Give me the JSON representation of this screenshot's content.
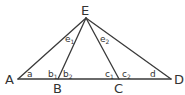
{
  "diagram": {
    "type": "geometry-triangle",
    "line_color": "#3a3a3a",
    "points": {
      "A": {
        "label": "A",
        "x": 18,
        "y": 79
      },
      "B": {
        "label": "B",
        "x": 58,
        "y": 79
      },
      "C": {
        "label": "C",
        "x": 119,
        "y": 79
      },
      "D": {
        "label": "D",
        "x": 171,
        "y": 79
      },
      "E": {
        "label": "E",
        "x": 86,
        "y": 18
      }
    },
    "segments": [
      "AD",
      "AE",
      "BE",
      "CE",
      "DE"
    ],
    "angles": {
      "a": {
        "base": "a",
        "sub": ""
      },
      "b1": {
        "base": "b",
        "sub": "1"
      },
      "b2": {
        "base": "b",
        "sub": "2"
      },
      "c1": {
        "base": "c",
        "sub": "1"
      },
      "c2": {
        "base": "c",
        "sub": "2"
      },
      "d": {
        "base": "d",
        "sub": ""
      },
      "e1": {
        "base": "e",
        "sub": "1"
      },
      "e2": {
        "base": "e",
        "sub": "2"
      }
    }
  }
}
